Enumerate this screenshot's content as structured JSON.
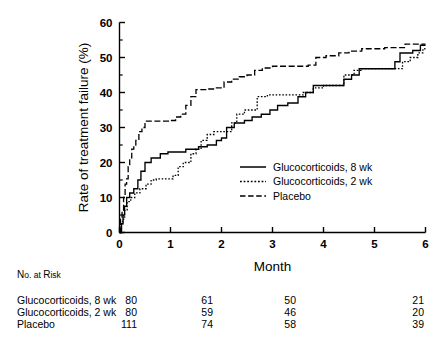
{
  "chart_data": {
    "type": "line",
    "subtype": "kaplan-meier-step",
    "title": "",
    "xlabel": "Month",
    "ylabel": "Rate of treatment failure (%)",
    "xlim": [
      0,
      6
    ],
    "ylim": [
      0,
      60
    ],
    "xticks": [
      0,
      1,
      2,
      3,
      4,
      5,
      6
    ],
    "xtick_labels": [
      "0",
      "1",
      "2",
      "3",
      "4",
      "5",
      "6"
    ],
    "yticks": [
      0,
      10,
      20,
      30,
      40,
      50,
      60
    ],
    "ytick_labels": [
      "0",
      "10",
      "20",
      "30",
      "40",
      "50",
      "60"
    ],
    "yticks_minor": [
      5,
      15,
      25,
      35,
      45,
      55
    ],
    "grid": false,
    "legend_position": "center-right-inside",
    "series": [
      {
        "name": "Glucocorticoids, 8 wk",
        "style": "solid",
        "points": [
          [
            0.0,
            0.0
          ],
          [
            0.04,
            2.5
          ],
          [
            0.07,
            5.0
          ],
          [
            0.1,
            7.5
          ],
          [
            0.14,
            10.0
          ],
          [
            0.2,
            11.3
          ],
          [
            0.28,
            12.5
          ],
          [
            0.36,
            15.0
          ],
          [
            0.42,
            17.5
          ],
          [
            0.5,
            20.0
          ],
          [
            0.62,
            21.3
          ],
          [
            0.72,
            21.3
          ],
          [
            0.8,
            22.5
          ],
          [
            0.95,
            23.0
          ],
          [
            1.15,
            23.0
          ],
          [
            1.3,
            23.8
          ],
          [
            1.55,
            24.5
          ],
          [
            1.72,
            25.0
          ],
          [
            1.9,
            26.3
          ],
          [
            2.0,
            27.0
          ],
          [
            2.1,
            30.0
          ],
          [
            2.25,
            31.3
          ],
          [
            2.45,
            32.0
          ],
          [
            2.6,
            33.0
          ],
          [
            2.78,
            33.8
          ],
          [
            2.95,
            35.0
          ],
          [
            3.1,
            36.3
          ],
          [
            3.3,
            37.0
          ],
          [
            3.5,
            38.8
          ],
          [
            3.65,
            40.0
          ],
          [
            3.8,
            42.0
          ],
          [
            4.0,
            42.0
          ],
          [
            4.25,
            42.0
          ],
          [
            4.4,
            43.8
          ],
          [
            4.55,
            45.0
          ],
          [
            4.7,
            46.8
          ],
          [
            5.0,
            46.8
          ],
          [
            5.25,
            46.8
          ],
          [
            5.4,
            48.8
          ],
          [
            5.5,
            51.3
          ],
          [
            5.75,
            52.0
          ],
          [
            5.9,
            53.5
          ],
          [
            6.0,
            53.5
          ]
        ]
      },
      {
        "name": "Glucocorticoids, 2 wk",
        "style": "dotted",
        "points": [
          [
            0.0,
            0.0
          ],
          [
            0.03,
            2.5
          ],
          [
            0.06,
            3.8
          ],
          [
            0.1,
            6.3
          ],
          [
            0.15,
            8.8
          ],
          [
            0.22,
            10.0
          ],
          [
            0.3,
            11.3
          ],
          [
            0.4,
            12.5
          ],
          [
            0.52,
            13.8
          ],
          [
            0.62,
            15.0
          ],
          [
            0.72,
            15.3
          ],
          [
            0.9,
            15.3
          ],
          [
            1.05,
            16.3
          ],
          [
            1.15,
            18.8
          ],
          [
            1.25,
            20.0
          ],
          [
            1.4,
            22.5
          ],
          [
            1.5,
            23.8
          ],
          [
            1.6,
            26.3
          ],
          [
            1.72,
            28.0
          ],
          [
            1.85,
            28.8
          ],
          [
            2.05,
            28.8
          ],
          [
            2.2,
            31.3
          ],
          [
            2.3,
            33.8
          ],
          [
            2.45,
            35.0
          ],
          [
            2.55,
            35.0
          ],
          [
            2.7,
            38.8
          ],
          [
            2.9,
            39.3
          ],
          [
            3.3,
            39.3
          ],
          [
            3.6,
            40.0
          ],
          [
            3.8,
            41.3
          ],
          [
            4.0,
            42.0
          ],
          [
            4.25,
            42.0
          ],
          [
            4.4,
            45.0
          ],
          [
            4.6,
            46.3
          ],
          [
            4.75,
            46.8
          ],
          [
            5.1,
            46.8
          ],
          [
            5.4,
            46.8
          ],
          [
            5.55,
            48.8
          ],
          [
            5.7,
            50.0
          ],
          [
            5.85,
            51.3
          ],
          [
            5.95,
            52.5
          ],
          [
            6.0,
            52.5
          ]
        ]
      },
      {
        "name": "Placebo",
        "style": "dashed",
        "points": [
          [
            0.0,
            0.0
          ],
          [
            0.02,
            3.8
          ],
          [
            0.05,
            6.3
          ],
          [
            0.08,
            10.0
          ],
          [
            0.11,
            13.8
          ],
          [
            0.14,
            15.3
          ],
          [
            0.17,
            18.8
          ],
          [
            0.2,
            21.3
          ],
          [
            0.24,
            23.8
          ],
          [
            0.28,
            25.0
          ],
          [
            0.32,
            26.3
          ],
          [
            0.38,
            28.8
          ],
          [
            0.44,
            30.0
          ],
          [
            0.5,
            31.8
          ],
          [
            0.75,
            31.8
          ],
          [
            1.0,
            32.0
          ],
          [
            1.1,
            33.0
          ],
          [
            1.2,
            33.8
          ],
          [
            1.3,
            36.3
          ],
          [
            1.4,
            38.8
          ],
          [
            1.5,
            40.8
          ],
          [
            1.72,
            41.0
          ],
          [
            1.9,
            41.3
          ],
          [
            2.05,
            43.0
          ],
          [
            2.2,
            43.8
          ],
          [
            2.35,
            44.5
          ],
          [
            2.5,
            45.0
          ],
          [
            2.65,
            46.3
          ],
          [
            2.8,
            47.0
          ],
          [
            3.0,
            47.5
          ],
          [
            3.4,
            47.5
          ],
          [
            3.7,
            47.8
          ],
          [
            3.85,
            50.0
          ],
          [
            4.05,
            50.5
          ],
          [
            4.3,
            51.3
          ],
          [
            4.5,
            51.8
          ],
          [
            4.75,
            52.5
          ],
          [
            5.2,
            52.8
          ],
          [
            5.45,
            52.8
          ],
          [
            5.6,
            53.8
          ],
          [
            5.85,
            53.8
          ],
          [
            6.0,
            53.8
          ]
        ]
      }
    ]
  },
  "legend": {
    "entries": [
      {
        "label": "Glucocorticoids, 8 wk",
        "style": "solid"
      },
      {
        "label": "Glucocorticoids, 2 wk",
        "style": "dotted"
      },
      {
        "label": "Placebo",
        "style": "dashed"
      }
    ]
  },
  "risk_table": {
    "heading": "No. at Risk",
    "heading_parts": {
      "a": "N",
      "b": "o.",
      "c": "at",
      "d": "R",
      "e": "isk"
    },
    "column_months": [
      0,
      2,
      4,
      6
    ],
    "rows": [
      {
        "label": "Glucocorticoids, 8 wk",
        "values": [
          "80",
          "61",
          "50",
          "21"
        ]
      },
      {
        "label": "Glucocorticoids, 2 wk",
        "values": [
          "80",
          "59",
          "46",
          "20"
        ]
      },
      {
        "label": "Placebo",
        "values": [
          "111",
          "74",
          "58",
          "39"
        ]
      }
    ]
  },
  "colors": {
    "ink": "#000000",
    "background": "#ffffff"
  }
}
